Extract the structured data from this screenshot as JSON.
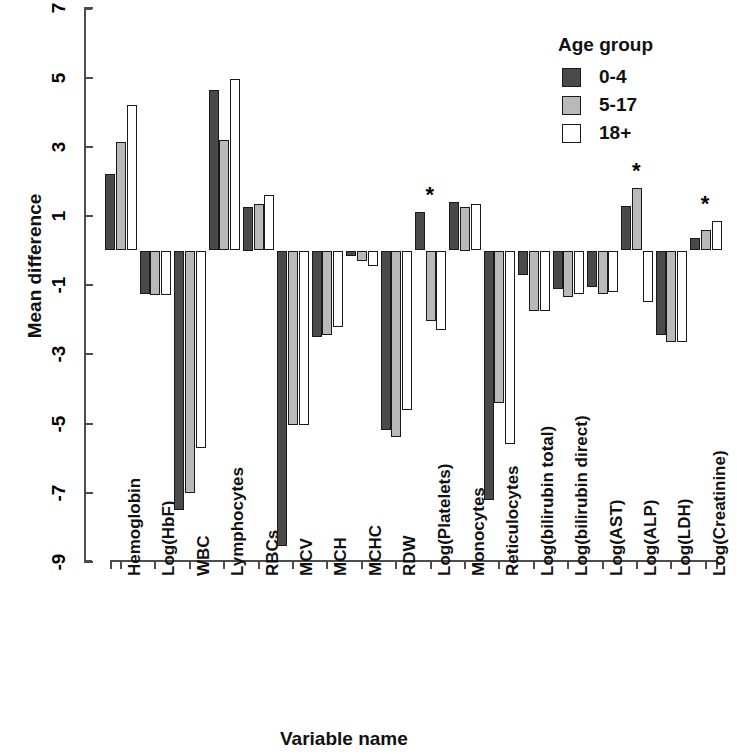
{
  "chart_data": {
    "type": "bar",
    "title": "",
    "xlabel": "Variable name",
    "ylabel": "Mean difference",
    "ylim": [
      -9,
      7
    ],
    "yticks": [
      7,
      5,
      3,
      1,
      -1,
      -3,
      -5,
      -7,
      -9
    ],
    "ytick_labels": [
      "7",
      "5",
      "3",
      "1",
      "-1",
      "-3",
      "-5",
      "-7",
      "-9"
    ],
    "grid": false,
    "legend_position": "top-right",
    "legend_title": "Age group",
    "categories": [
      "Hemoglobin",
      "Log(HbF)",
      "WBC",
      "Lymphocytes",
      "RBCs",
      "MCV",
      "MCH",
      "MCHC",
      "RDW",
      "Log(Platelets)",
      "Monocytes",
      "Reticulocytes",
      "Log(bilirubin total)",
      "Log(bilirubin direct)",
      "Log(AST)",
      "Log(ALP)",
      "Log(LDH)",
      "Log(Creatinine)"
    ],
    "series": [
      {
        "name": "0-4",
        "color": "#4a4a4a",
        "values": [
          2.2,
          -1.25,
          -7.5,
          4.65,
          1.25,
          -8.55,
          -2.5,
          -0.15,
          -5.2,
          1.1,
          1.4,
          -7.2,
          -0.7,
          -1.1,
          -1.05,
          1.3,
          -2.45,
          0.35
        ]
      },
      {
        "name": "5-17",
        "color": "#b9b9b9",
        "values": [
          3.15,
          -1.3,
          -7.0,
          3.2,
          1.35,
          -5.05,
          -2.45,
          -0.3,
          -5.4,
          -2.05,
          1.25,
          -4.4,
          -1.75,
          -1.35,
          -1.25,
          1.8,
          -2.65,
          0.6
        ]
      },
      {
        "name": "18+",
        "color": "#ffffff",
        "values": [
          4.2,
          -1.3,
          -5.7,
          4.95,
          1.6,
          -5.05,
          -2.2,
          -0.45,
          -4.6,
          -2.3,
          1.35,
          -5.6,
          -1.75,
          -1.25,
          -1.2,
          -1.5,
          -2.65,
          0.85
        ]
      }
    ],
    "significance_marked": [
      "Log(Platelets)",
      "Log(ALP)",
      "Log(Creatinine)"
    ],
    "significance_symbol": "*"
  },
  "legend": {
    "title": "Age group",
    "items": [
      {
        "label": "0-4",
        "color": "#4a4a4a"
      },
      {
        "label": "5-17",
        "color": "#b9b9b9"
      },
      {
        "label": "18+",
        "color": "#ffffff"
      }
    ]
  },
  "axes": {
    "y_title": "Mean difference",
    "x_title": "Variable name"
  }
}
